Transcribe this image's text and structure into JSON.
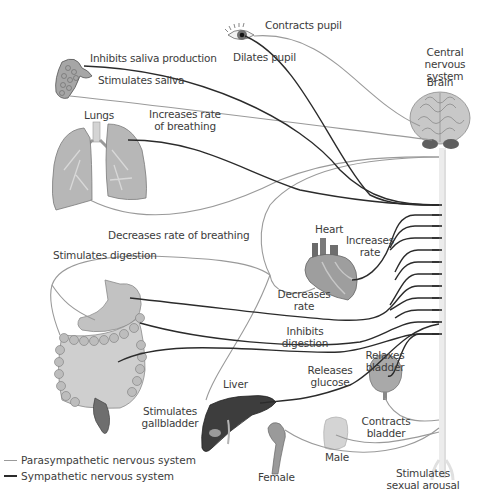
{
  "diagram": {
    "title_cns": "Central nervous\nsystem",
    "brain_label": "Brain",
    "organs": {
      "eye": {
        "label_parasympathetic": "Contracts pupil",
        "label_sympathetic": "Dilates pupil"
      },
      "salivary_gland": {
        "label_sympathetic": "Inhibits saliva production",
        "label_parasympathetic": "Stimulates saliva"
      },
      "lungs": {
        "name": "Lungs",
        "label_sympathetic": "Increases rate\nof breathing",
        "label_parasympathetic": "Decreases rate of breathing"
      },
      "heart": {
        "name": "Heart",
        "label_sympathetic": "Increases\nrate",
        "label_parasympathetic": "Decreases\nrate"
      },
      "digestive": {
        "label_parasympathetic": "Stimulates digestion",
        "label_sympathetic": "Inhibits\ndigestion"
      },
      "liver": {
        "name": "Liver",
        "label_sympathetic": "Releases\nglucose",
        "label_parasympathetic": "Stimulates\ngallbladder"
      },
      "bladder": {
        "label_sympathetic": "Relaxes\nbladder",
        "label_parasympathetic": "Contracts\nbladder"
      },
      "reproductive": {
        "male": "Male",
        "female": "Female",
        "label_parasympathetic": "Stimulates\nsexual arousal"
      }
    },
    "legend": [
      {
        "label": "Parasympathetic nervous system",
        "color": "#9a9a9a"
      },
      {
        "label": "Sympathetic nervous system",
        "color": "#2b2b2b"
      }
    ],
    "colors": {
      "parasympathetic": "#9a9a9a",
      "sympathetic": "#2b2b2b",
      "spinal_cord": "#e4e4e4",
      "organ_gray": "#b9b9b9",
      "liver": "#3d3d3d"
    }
  }
}
